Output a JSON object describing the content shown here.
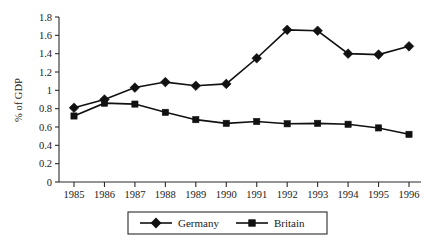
{
  "chart_data": {
    "type": "line",
    "title": "",
    "xlabel": "",
    "ylabel": "% of GDP",
    "categories": [
      "1985",
      "1986",
      "1987",
      "1988",
      "1989",
      "1990",
      "1991",
      "1992",
      "1993",
      "1994",
      "1995",
      "1996"
    ],
    "ylim": [
      0,
      1.8
    ],
    "yticks": [
      "0",
      "0.2",
      "0.4",
      "0.6",
      "0.8",
      "1",
      "1.2",
      "1.4",
      "1.6",
      "1.8"
    ],
    "ytick_values": [
      0,
      0.2,
      0.4,
      0.6,
      0.8,
      1,
      1.2,
      1.4,
      1.6,
      1.8
    ],
    "grid": false,
    "legend_position": "bottom",
    "series": [
      {
        "name": "Germany",
        "marker": "diamond",
        "color": "#111111",
        "values": [
          0.81,
          0.9,
          1.03,
          1.09,
          1.05,
          1.07,
          1.35,
          1.66,
          1.65,
          1.4,
          1.39,
          1.48
        ]
      },
      {
        "name": "Britain",
        "marker": "square",
        "color": "#111111",
        "values": [
          0.72,
          0.86,
          0.85,
          0.76,
          0.68,
          0.64,
          0.66,
          0.635,
          0.64,
          0.63,
          0.59,
          0.52
        ]
      }
    ]
  },
  "legend": {
    "items": [
      {
        "label": "Germany",
        "marker": "diamond"
      },
      {
        "label": "Britain",
        "marker": "square"
      }
    ]
  }
}
